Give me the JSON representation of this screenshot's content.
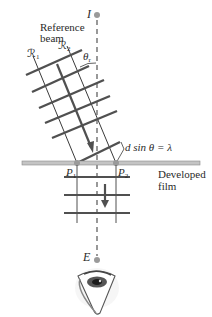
{
  "figure": {
    "reference_beam_label_line1": "Reference",
    "reference_beam_label_line2": "beam",
    "ray1_label": "ℛ",
    "ray1_sub": "1",
    "ray2_label": "ℛ",
    "ray2_sub": "2",
    "angle_label": "θ",
    "angle_sub": "r",
    "source_label": "I",
    "equation_label": "d sin θ = λ",
    "point1_label": "P",
    "point1_sub": "1",
    "point2_label": "P",
    "point2_sub": "2",
    "film_label_line1": "Developed",
    "film_label_line2": "film",
    "eye_label": "E"
  },
  "colors": {
    "line": "#3a3a3a",
    "thick_line": "#505050",
    "film": "#bdbdbd",
    "point": "#9a9a9a",
    "dashed": "#555555"
  }
}
